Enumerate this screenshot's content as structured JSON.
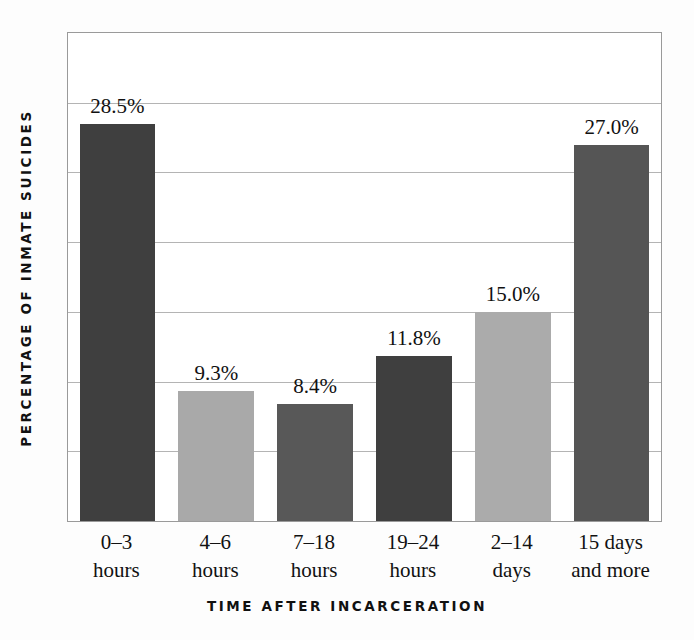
{
  "chart_data": {
    "type": "bar",
    "title": "",
    "xlabel": "TIME AFTER INCARCERATION",
    "ylabel": "PERCENTAGE OF INMATE SUICIDES",
    "categories": [
      "0–3 hours",
      "4–6 hours",
      "7–18 hours",
      "19–24 hours",
      "2–14 days",
      "15 days and more"
    ],
    "category_lines": [
      {
        "line1": "0–3",
        "line2": "hours"
      },
      {
        "line1": "4–6",
        "line2": "hours"
      },
      {
        "line1": "7–18",
        "line2": "hours"
      },
      {
        "line1": "19–24",
        "line2": "hours"
      },
      {
        "line1": "2–14",
        "line2": "days"
      },
      {
        "line1": "15 days",
        "line2": "and more"
      }
    ],
    "values": [
      28.5,
      9.3,
      8.4,
      11.8,
      15.0,
      27.0
    ],
    "value_labels": [
      "28.5%",
      "9.3%",
      "8.4%",
      "11.8%",
      "15.0%",
      "27.0%"
    ],
    "bar_colors": [
      "#3f3f3f",
      "#a9a9a9",
      "#585858",
      "#3f3f3f",
      "#ababab",
      "#555555"
    ],
    "ylim": [
      0,
      35
    ],
    "gridlines": [
      5,
      10,
      15,
      20,
      25,
      30
    ],
    "grid": true,
    "grid_color": "#b4b4b4",
    "frame_color": "#9a9a9a",
    "legend": "none",
    "ytick_labels": []
  }
}
